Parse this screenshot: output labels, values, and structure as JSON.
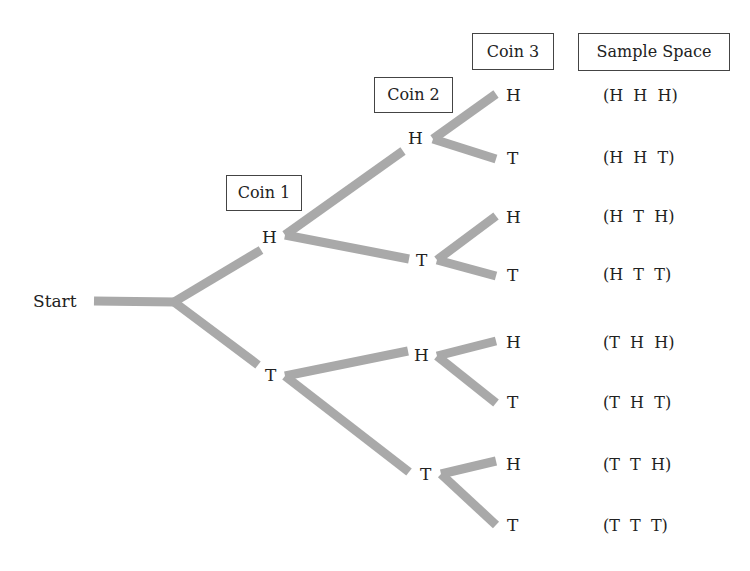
{
  "diagram": {
    "type": "tree-diagram",
    "start_label": "Start",
    "headers": {
      "coin1": "Coin 1",
      "coin2": "Coin 2",
      "coin3": "Coin 3",
      "sample_space": "Sample Space"
    },
    "branch_color": "#a9a9a9",
    "coin1_nodes": [
      "H",
      "T"
    ],
    "coin2_nodes": [
      "H",
      "T",
      "H",
      "T"
    ],
    "coin3_nodes": [
      "H",
      "T",
      "H",
      "T",
      "H",
      "T",
      "H",
      "T"
    ],
    "sample_space": [
      "(H  H  H)",
      "(H  H  T)",
      "(H  T  H)",
      "(H  T  T)",
      "(T  H  H)",
      "(T  H  T)",
      "(T  T  H)",
      "(T  T  T)"
    ]
  }
}
